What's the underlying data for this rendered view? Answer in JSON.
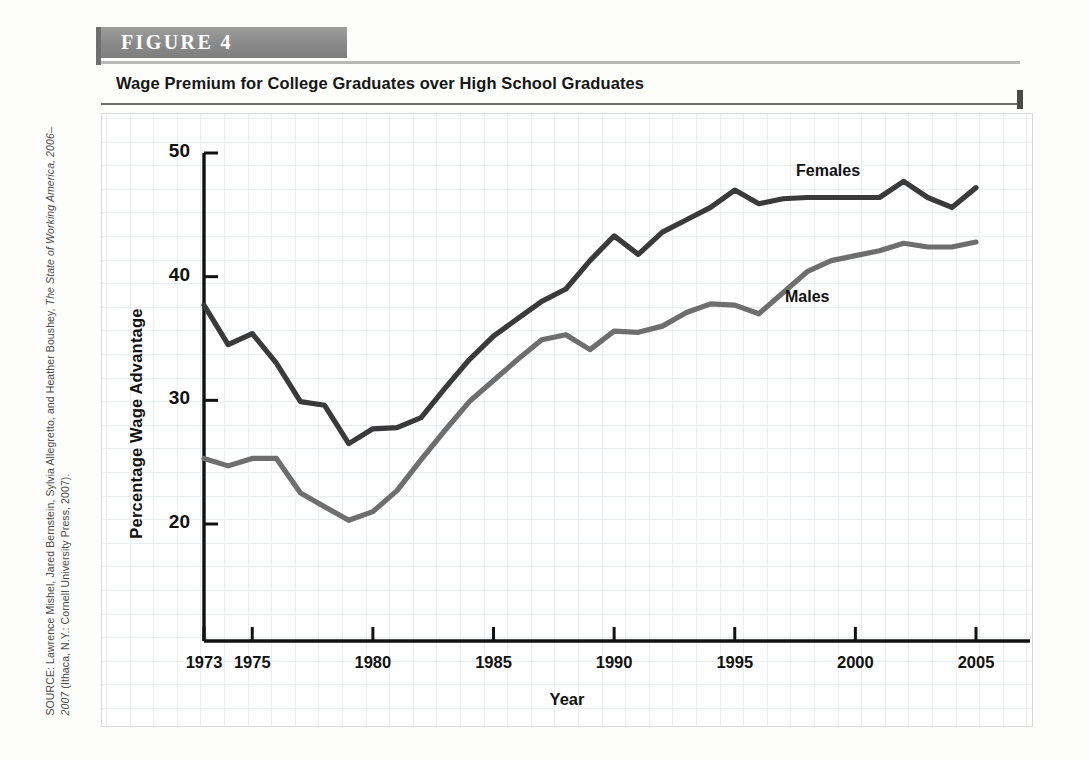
{
  "figure": {
    "banner_label": "FIGURE  4",
    "title": "Wage Premium for College Graduates over High School Graduates"
  },
  "source": {
    "prefix": "SOURCE: Lawrence Mishel, Jared Bernstein, Sylvia Allegretto, and Heather Boushey, ",
    "italic": "The State of Working America, 2006–2007",
    "suffix": " (Ithaca, N.Y.: Cornell University Press, 2007)."
  },
  "colors": {
    "females_line": "#3a3a3a",
    "males_line": "#6e6e6e",
    "banner": "#8a8a8a",
    "grid": "#e9eef3",
    "axis": "#111111"
  },
  "axis": {
    "y_ticks": [
      "20",
      "30",
      "40",
      "50"
    ],
    "x_ticks": [
      "1973",
      "1975",
      "1980",
      "1985",
      "1990",
      "1995",
      "2000",
      "2005"
    ],
    "x_title": "Year",
    "y_title": "Percentage Wage Advantage"
  },
  "annotations": {
    "females": "Females",
    "males": "Males"
  },
  "chart_data": {
    "type": "line",
    "title": "Wage Premium for College Graduates over High School Graduates",
    "xlabel": "Year",
    "ylabel": "Percentage Wage Advantage",
    "xlim": [
      1973,
      2005
    ],
    "ylim": [
      13.5,
      50
    ],
    "y_ticks": [
      20,
      30,
      40,
      50
    ],
    "x_ticks": [
      1973,
      1975,
      1980,
      1985,
      1990,
      1995,
      2000,
      2005
    ],
    "grid": true,
    "legend": "inline-annotations",
    "x": [
      1973,
      1974,
      1975,
      1976,
      1977,
      1978,
      1979,
      1980,
      1981,
      1982,
      1983,
      1984,
      1985,
      1986,
      1987,
      1988,
      1989,
      1990,
      1991,
      1992,
      1993,
      1994,
      1995,
      1996,
      1997,
      1998,
      1999,
      2000,
      2001,
      2002,
      2003,
      2004,
      2005
    ],
    "series": [
      {
        "name": "Females",
        "color": "#3a3a3a",
        "values": [
          37.7,
          34.5,
          35.4,
          33.0,
          29.9,
          29.6,
          26.5,
          27.7,
          27.8,
          28.6,
          31.0,
          33.3,
          35.2,
          36.6,
          38.0,
          39.0,
          41.3,
          43.3,
          41.8,
          43.6,
          44.6,
          45.6,
          47.0,
          45.9,
          46.3,
          46.4,
          46.4,
          46.4,
          46.4,
          47.7,
          46.4,
          45.6,
          47.2
        ]
      },
      {
        "name": "Males",
        "color": "#6e6e6e",
        "values": [
          25.3,
          24.7,
          25.3,
          25.3,
          22.5,
          21.4,
          20.3,
          21.0,
          22.7,
          25.2,
          27.6,
          29.9,
          31.6,
          33.3,
          34.9,
          35.3,
          34.1,
          35.6,
          35.5,
          36.0,
          37.1,
          37.8,
          37.7,
          37.0,
          38.7,
          40.4,
          41.3,
          41.7,
          42.1,
          42.7,
          42.4,
          42.4,
          42.8
        ]
      }
    ]
  }
}
